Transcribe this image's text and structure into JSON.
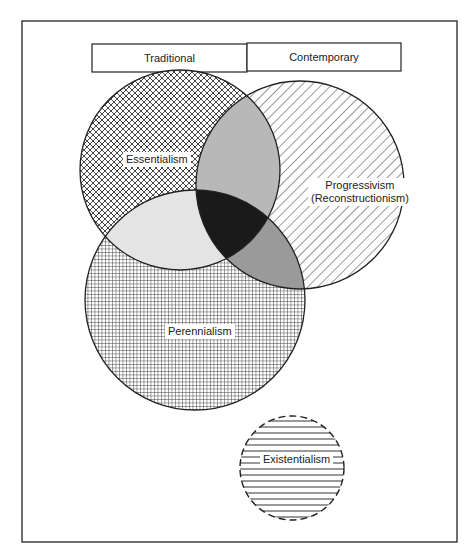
{
  "diagram": {
    "type": "venn",
    "header": {
      "left_label": "Traditional",
      "right_label": "Contemporary"
    },
    "sets": [
      {
        "id": "essentialism",
        "label": "Essentialism",
        "fill_pattern": "crosshatch-diagonal",
        "border": "solid",
        "group": "Traditional"
      },
      {
        "id": "progressivism",
        "label_line1": "Progressivism",
        "label_line2": "(Reconstructionism)",
        "fill_pattern": "diagonal-lines",
        "border": "solid",
        "group": "Contemporary"
      },
      {
        "id": "perennialism",
        "label": "Perennialism",
        "fill_pattern": "grid",
        "border": "solid",
        "group": "Traditional"
      },
      {
        "id": "existentialism",
        "label": "Existentialism",
        "fill_pattern": "horizontal-lines",
        "border": "dashed",
        "group": "Contemporary"
      }
    ],
    "overlaps": [
      {
        "sets": [
          "essentialism",
          "progressivism"
        ],
        "fill": "#b8b8b8"
      },
      {
        "sets": [
          "essentialism",
          "perennialism"
        ],
        "fill": "#e4e4e4"
      },
      {
        "sets": [
          "progressivism",
          "perennialism"
        ],
        "fill": "#9a9a9a"
      },
      {
        "sets": [
          "essentialism",
          "progressivism",
          "perennialism"
        ],
        "fill": "#1a1a1a"
      }
    ],
    "colors": {
      "stroke": "#222222",
      "background": "#ffffff"
    }
  }
}
